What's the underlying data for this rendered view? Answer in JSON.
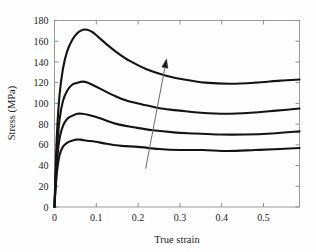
{
  "chart_data": {
    "type": "line",
    "title": "",
    "xlabel": "True strain",
    "ylabel": "Stress (MPa)",
    "xlim": [
      0,
      0.586
    ],
    "ylim": [
      0,
      180
    ],
    "xticks": [
      "0",
      "0.1",
      "0.2",
      "0.3",
      "0.4",
      "0.5"
    ],
    "xtick_values": [
      0,
      0.1,
      0.2,
      0.3,
      0.4,
      0.5
    ],
    "yticks": [
      "0",
      "20",
      "40",
      "60",
      "80",
      "100",
      "120",
      "140",
      "160",
      "180"
    ],
    "ytick_values": [
      0,
      20,
      40,
      60,
      80,
      100,
      120,
      140,
      160,
      180
    ],
    "grid": false,
    "legend": "none",
    "annotations": [
      {
        "name": "increasing-trend-arrow",
        "type": "arrow",
        "from": [
          0.218,
          37
        ],
        "to": [
          0.268,
          143
        ],
        "label": ""
      }
    ],
    "series": [
      {
        "name": "curve-1-highest",
        "peak_strain": 0.078,
        "peak_stress": 171,
        "end_strain": 0.586,
        "end_stress": 123,
        "x": [
          0.0,
          0.002,
          0.006,
          0.012,
          0.02,
          0.03,
          0.042,
          0.055,
          0.068,
          0.078,
          0.09,
          0.105,
          0.125,
          0.15,
          0.18,
          0.22,
          0.265,
          0.31,
          0.36,
          0.42,
          0.48,
          0.54,
          0.586
        ],
        "y": [
          0,
          28,
          72,
          108,
          133,
          150,
          161,
          168,
          171,
          171,
          169,
          164,
          157,
          149,
          141,
          133,
          127,
          123,
          120,
          119,
          120,
          122,
          123
        ]
      },
      {
        "name": "curve-2",
        "peak_strain": 0.072,
        "peak_stress": 121,
        "end_strain": 0.586,
        "end_stress": 95,
        "x": [
          0.0,
          0.002,
          0.006,
          0.012,
          0.02,
          0.03,
          0.042,
          0.055,
          0.068,
          0.08,
          0.095,
          0.115,
          0.14,
          0.17,
          0.21,
          0.255,
          0.3,
          0.35,
          0.41,
          0.47,
          0.53,
          0.586
        ],
        "y": [
          0,
          22,
          56,
          84,
          102,
          112,
          118,
          120,
          121,
          120,
          117,
          113,
          108,
          103,
          99,
          95,
          93,
          91,
          90,
          91,
          93,
          95
        ]
      },
      {
        "name": "curve-3",
        "peak_strain": 0.066,
        "peak_stress": 90,
        "end_strain": 0.586,
        "end_stress": 73,
        "x": [
          0.0,
          0.002,
          0.006,
          0.012,
          0.02,
          0.03,
          0.042,
          0.055,
          0.066,
          0.08,
          0.098,
          0.12,
          0.15,
          0.19,
          0.235,
          0.285,
          0.335,
          0.395,
          0.455,
          0.52,
          0.586
        ],
        "y": [
          0,
          18,
          44,
          66,
          78,
          85,
          88,
          90,
          90,
          89,
          87,
          84,
          80,
          77,
          74,
          72,
          71,
          70,
          70,
          71,
          73
        ]
      },
      {
        "name": "curve-4-lowest",
        "peak_strain": 0.06,
        "peak_stress": 65,
        "end_strain": 0.586,
        "end_stress": 57,
        "x": [
          0.0,
          0.002,
          0.006,
          0.012,
          0.02,
          0.03,
          0.042,
          0.052,
          0.062,
          0.078,
          0.098,
          0.125,
          0.16,
          0.2,
          0.25,
          0.3,
          0.355,
          0.415,
          0.48,
          0.54,
          0.586
        ],
        "y": [
          0,
          14,
          34,
          50,
          58,
          62,
          64,
          65,
          65,
          64,
          63,
          61,
          59,
          58,
          56,
          55,
          55,
          54,
          55,
          56,
          57
        ]
      }
    ]
  }
}
